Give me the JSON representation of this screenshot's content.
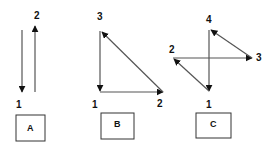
{
  "figure": {
    "panels": [
      {
        "id": "A",
        "box_label": "A",
        "points": [
          {
            "label": "1",
            "desc": "bottom"
          },
          {
            "label": "2",
            "desc": "top"
          }
        ],
        "arrows": [
          {
            "from": "top",
            "to": "1",
            "desc": "downward arrow ending at point 1"
          },
          {
            "from": "1",
            "to": "2",
            "desc": "upward arrow ending at point 2"
          }
        ]
      },
      {
        "id": "B",
        "box_label": "B",
        "points": [
          {
            "label": "1",
            "desc": "bottom-left"
          },
          {
            "label": "2",
            "desc": "bottom-right"
          },
          {
            "label": "3",
            "desc": "top-left"
          }
        ],
        "arrows": [
          {
            "from": "3",
            "to": "1"
          },
          {
            "from": "1",
            "to": "2"
          },
          {
            "from": "2",
            "to": "3"
          }
        ]
      },
      {
        "id": "C",
        "box_label": "C",
        "points": [
          {
            "label": "1",
            "desc": "bottom"
          },
          {
            "label": "2",
            "desc": "left"
          },
          {
            "label": "3",
            "desc": "right"
          },
          {
            "label": "4",
            "desc": "top"
          }
        ],
        "arrows": [
          {
            "from": "4",
            "to": "1"
          },
          {
            "from": "1",
            "to": "2"
          },
          {
            "from": "2",
            "to": "3"
          },
          {
            "from": "3",
            "to": "4"
          }
        ]
      }
    ]
  },
  "colors": {
    "line": "#555555",
    "arrowhead": "#111111",
    "text": "#111111",
    "box_border": "#333333",
    "background": "#ffffff"
  }
}
